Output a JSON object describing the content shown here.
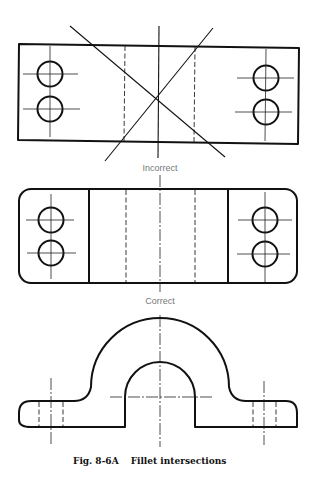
{
  "figure": {
    "number": "Fig. 8-6A",
    "title": "Fillet intersections"
  },
  "views": [
    {
      "id": "top-view-incorrect",
      "label": "Incorrect"
    },
    {
      "id": "top-view-correct",
      "label": "Correct"
    },
    {
      "id": "front-view",
      "label": ""
    }
  ],
  "colors": {
    "line": "#111111",
    "label": "#777777",
    "background": "#ffffff"
  }
}
